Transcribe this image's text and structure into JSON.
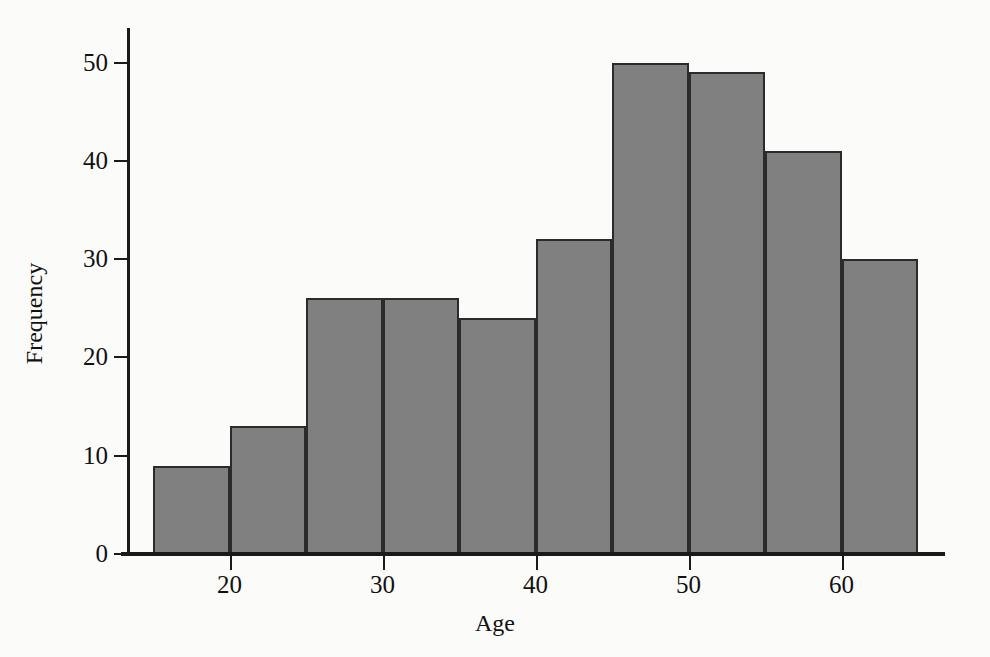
{
  "chart_data": {
    "type": "bar",
    "title": "",
    "subtitle": "",
    "xlabel": "Age",
    "ylabel": "Frequency",
    "xlim": [
      13.5,
      66.5
    ],
    "ylim": [
      0,
      53
    ],
    "grid": false,
    "legend": null,
    "bin_width": 5,
    "bin_edges": [
      15,
      20,
      25,
      30,
      35,
      40,
      45,
      50,
      55,
      60,
      65
    ],
    "categories": [
      "15-20",
      "20-25",
      "25-30",
      "30-35",
      "35-40",
      "40-45",
      "45-50",
      "50-55",
      "55-60",
      "60-65"
    ],
    "values": [
      9,
      13,
      26,
      26,
      24,
      32,
      50,
      49,
      41,
      30
    ],
    "xticks": [
      20,
      30,
      40,
      50,
      60
    ],
    "xtick_labels": [
      "20",
      "30",
      "40",
      "50",
      "60"
    ],
    "yticks": [
      0,
      10,
      20,
      30,
      40,
      50
    ],
    "ytick_labels": [
      "0",
      "10",
      "20",
      "30",
      "40",
      "50"
    ],
    "bar_fill_color": "#808080",
    "bar_edge_color": "#2b2b2b",
    "background_color": "#fbfbf9",
    "axis_color": "#1a1a1a"
  }
}
